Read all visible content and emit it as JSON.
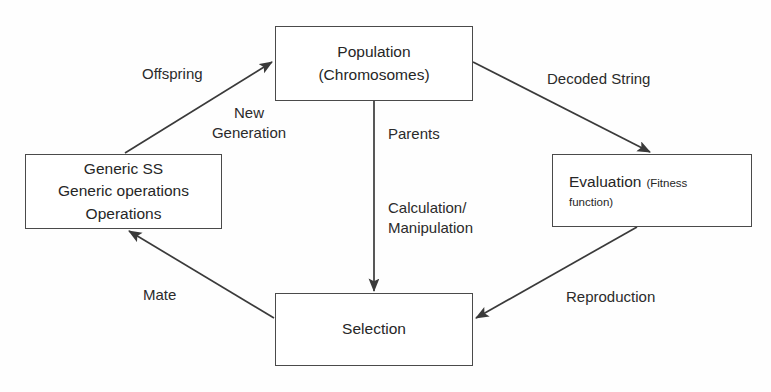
{
  "diagram": {
    "type": "flow-diagram",
    "background_color": "#fefefe",
    "stroke_color": "#4a4a4a",
    "text_color": "#262626"
  },
  "nodes": {
    "population": {
      "line1": "Population",
      "line2": "(Chromosomes)"
    },
    "evaluation": {
      "main": "Evaluation",
      "note1": "(Fitness",
      "note2": "function)"
    },
    "operations": {
      "line1": "Generic SS",
      "line2": "Generic operations",
      "line3": "Operations"
    },
    "selection": {
      "label": "Selection"
    }
  },
  "edges": {
    "offspring": "Offspring",
    "new_generation": "New\nGeneration",
    "decoded_string": "Decoded String",
    "parents": "Parents",
    "calculation": "Calculation/\nManipulation",
    "mate": "Mate",
    "reproduction": "Reproduction"
  }
}
